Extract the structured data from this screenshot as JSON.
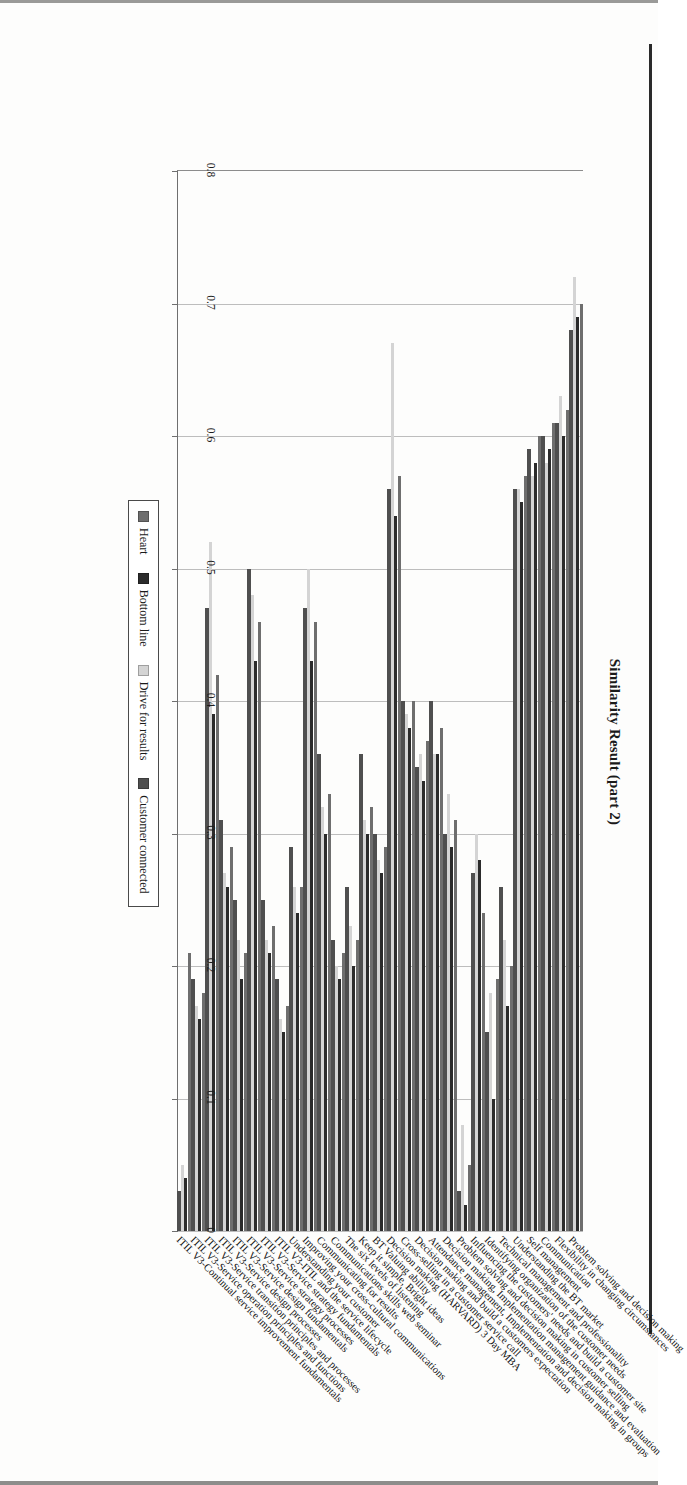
{
  "chart_data": {
    "type": "bar",
    "orientation": "horizontal",
    "title": "Similarity Result (part 2)",
    "xlabel": "",
    "ylabel": "",
    "xlim": [
      0,
      0.8
    ],
    "x_ticks": [
      "0.8",
      "0.7",
      "0.6",
      "0.5",
      "0.4",
      "0.3",
      "0.2",
      "0.1",
      "0"
    ],
    "x_tick_values": [
      0.8,
      0.7,
      0.6,
      0.5,
      0.4,
      0.3,
      0.2,
      0.1,
      0
    ],
    "axis_direction": "reversed-right-to-left",
    "grid": true,
    "legend_position": "outside-right",
    "categories": [
      "Problem solving and decision making",
      "Flexibility in changing circumstances",
      "Communication",
      "Self management",
      "Understanding the BT market",
      "Technical management and professionality",
      "Identifying organization of the customer needs",
      "Influencing the customers' needs and build a customer site",
      "Problem solving and decision making in customer selling",
      "Decision making, Implementation management guidance and evaluation",
      "Attendance management, Implementation and decision making in groups",
      "Decision making and build a customers expectation",
      "Cross-selling in a customer service call",
      "Decision making (HARVARD) 3 Day MBA",
      "BT Valuing ability",
      "Keep it simple, Bright ideas",
      "The six levels of listening",
      "Communications skills web seminar",
      "Communicating for results",
      "Improving your cross-cultural communications",
      "Understanding your customer",
      "ITIL V3-ITIL and the service lifecycle",
      "ITIL V3-Service strategy fundamentals",
      "ITIL V3-Service strategy processes",
      "ITIL V3-Service design fundamentals",
      "ITIL V3-Service design processes",
      "ITIL V3-Service transition principles and processes",
      "ITIL V3-Service operation principles and functions",
      "ITIL V3-Continual service improvement fundamentals"
    ],
    "series": [
      {
        "name": "Heart",
        "color": "#6e6e6e",
        "values": [
          0.7,
          0.62,
          0.61,
          0.6,
          0.57,
          0.2,
          0.19,
          0.24,
          0.05,
          0.31,
          0.38,
          0.37,
          0.4,
          0.57,
          0.29,
          0.32,
          0.22,
          0.21,
          0.33,
          0.46,
          0.26,
          0.17,
          0.23,
          0.46,
          0.21,
          0.29,
          0.42,
          0.18,
          0.21
        ]
      },
      {
        "name": "Bottom line",
        "color": "#2b2b2b",
        "values": [
          0.69,
          0.6,
          0.59,
          0.58,
          0.55,
          0.17,
          0.1,
          0.28,
          0.02,
          0.29,
          0.36,
          0.34,
          0.38,
          0.54,
          0.27,
          0.3,
          0.2,
          0.19,
          0.3,
          0.43,
          0.24,
          0.15,
          0.21,
          0.43,
          0.19,
          0.26,
          0.39,
          0.16,
          0.04
        ]
      },
      {
        "name": "Drive for results",
        "color": "#d4d4d4",
        "values": [
          0.72,
          0.63,
          0.58,
          0.57,
          0.56,
          0.22,
          0.18,
          0.3,
          0.08,
          0.33,
          0.36,
          0.36,
          0.39,
          0.67,
          0.28,
          0.31,
          0.23,
          0.2,
          0.32,
          0.5,
          0.26,
          0.16,
          0.22,
          0.48,
          0.22,
          0.27,
          0.52,
          0.17,
          0.05
        ]
      },
      {
        "name": "Customer connected",
        "color": "#4f4f4f",
        "values": [
          0.68,
          0.61,
          0.6,
          0.59,
          0.56,
          0.26,
          0.15,
          0.27,
          0.03,
          0.3,
          0.4,
          0.35,
          0.4,
          0.56,
          0.3,
          0.36,
          0.26,
          0.22,
          0.36,
          0.47,
          0.29,
          0.19,
          0.25,
          0.5,
          0.25,
          0.31,
          0.47,
          0.19,
          0.03
        ]
      }
    ]
  },
  "legend": {
    "items": [
      {
        "label": "Heart",
        "color": "#6e6e6e"
      },
      {
        "label": "Bottom line",
        "color": "#2b2b2b"
      },
      {
        "label": "Drive for results",
        "color": "#d4d4d4"
      },
      {
        "label": "Customer connected",
        "color": "#4f4f4f"
      }
    ]
  }
}
